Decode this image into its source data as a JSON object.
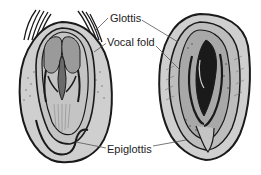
{
  "diagram": {
    "labels": [
      {
        "id": "glottis",
        "text": "Glottis"
      },
      {
        "id": "vocal_fold",
        "text": "Vocal fold"
      },
      {
        "id": "epiglottis",
        "text": "Epiglottis"
      }
    ],
    "figures": [
      {
        "id": "left",
        "description": "Larynx with vocal folds closed"
      },
      {
        "id": "right",
        "description": "Larynx with vocal folds open"
      }
    ],
    "colors": {
      "outline": "#1a1a1a",
      "fill_light": "#cfcfcf",
      "fill_mid": "#9a9a9a",
      "fill_dark": "#3a3a3a",
      "line": "#555555",
      "background": "#ffffff"
    }
  }
}
